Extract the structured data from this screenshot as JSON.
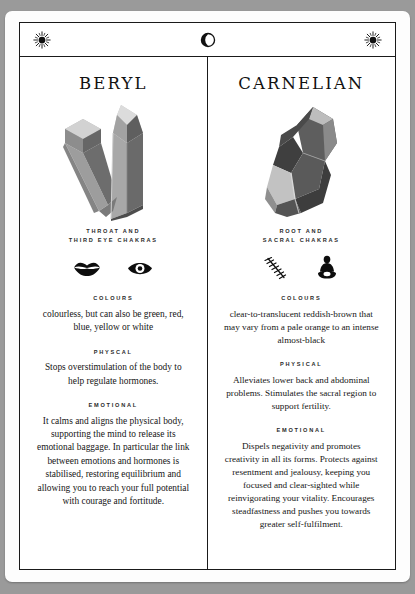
{
  "header": {
    "left_icon": "sun-icon",
    "center_icon": "crescent-moon-icon",
    "right_icon": "sun-icon"
  },
  "colors": {
    "background": "#9a9a9a",
    "card": "#fdfdfd",
    "rule": "#1a1a1a",
    "text": "#161616",
    "crystal_light": "#d8d8d8",
    "crystal_mid": "#9e9e9e",
    "crystal_dark": "#6a6a6a",
    "crystal_darkest": "#4a4a4a"
  },
  "columns": [
    {
      "title": "BERYL",
      "stone_icon": "twin-crystal-point-icon",
      "chakra_label_line1": "THROAT AND",
      "chakra_label_line2": "THIRD EYE CHAKRAS",
      "chakra_icons": [
        "lips-icon",
        "eye-icon"
      ],
      "sections": [
        {
          "label": "COLOURS",
          "text": "colourless, but can also be green, red, blue, yellow or white"
        },
        {
          "label": "PHYSCAL",
          "text": "Stops overstimulation of the body to help regulate hormones."
        },
        {
          "label": "EMOTIONAL",
          "text": "It calms and aligns the physical body, supporting the mind to release its emotional baggage. In particular the link between emotions and hormones is stabilised, restoring equilibrium and allowing you to reach your full potential with courage and fortitude."
        }
      ]
    },
    {
      "title": "CARNELIAN",
      "stone_icon": "faceted-gemstone-icon",
      "chakra_label_line1": "ROOT AND",
      "chakra_label_line2": "SACRAL CHAKRAS",
      "chakra_icons": [
        "spine-vertebrae-icon",
        "seated-meditation-figure-icon"
      ],
      "sections": [
        {
          "label": "COLOURS",
          "text": "clear-to-translucent reddish-brown that may vary from a pale orange to an intense almost-black"
        },
        {
          "label": "PHYSICAL",
          "text": "Alleviates lower back and abdominal problems. Stimulates the sacral region to support fertility."
        },
        {
          "label": "EMOTIONAL",
          "text": "Dispels negativity and promotes creativity in all its forms. Protects against resentment and jealousy, keeping you focused and clear-sighted while reinvigorating your vitality. Encourages steadfastness and pushes you towards greater self-fulfilment."
        }
      ]
    }
  ]
}
